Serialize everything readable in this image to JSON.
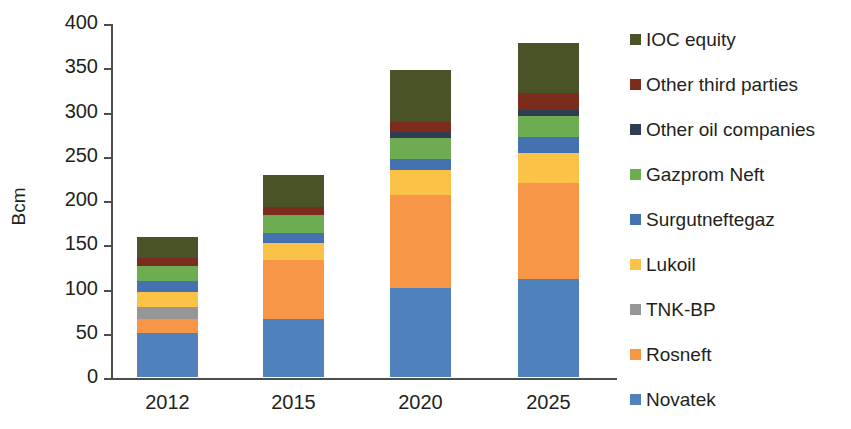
{
  "chart_data": {
    "type": "bar",
    "stacked": true,
    "title": "",
    "xlabel": "",
    "ylabel": "Bcm",
    "ylim": [
      0,
      400
    ],
    "ytick_step": 50,
    "yticks": [
      0,
      50,
      100,
      150,
      200,
      250,
      300,
      350,
      400
    ],
    "ytick_labels": [
      "0",
      "50",
      "100",
      "150",
      "200",
      "250",
      "300",
      "350",
      "400"
    ],
    "categories": [
      "2012",
      "2015",
      "2020",
      "2025"
    ],
    "grid": false,
    "legend_position": "right",
    "series": [
      {
        "name": "Novatek",
        "color": "#4f81bd",
        "values": [
          50,
          66,
          101,
          111
        ]
      },
      {
        "name": "Rosneft",
        "color": "#f79646",
        "values": [
          15,
          66,
          105,
          108
        ]
      },
      {
        "name": "TNK-BP",
        "color": "#969696",
        "values": [
          14,
          0,
          0,
          0
        ]
      },
      {
        "name": "Lukoil",
        "color": "#fac348",
        "values": [
          17,
          19,
          28,
          34
        ]
      },
      {
        "name": "Surgutneftegaz",
        "color": "#4472b0",
        "values": [
          13,
          12,
          12,
          18
        ]
      },
      {
        "name": "Gazprom Neft",
        "color": "#6eac52",
        "values": [
          16,
          20,
          24,
          24
        ]
      },
      {
        "name": "Other oil companies",
        "color": "#2f3c52",
        "values": [
          0,
          0,
          7,
          7
        ]
      },
      {
        "name": "Other third parties",
        "color": "#7b2c1c",
        "values": [
          9,
          9,
          11,
          19
        ]
      },
      {
        "name": "IOC equity",
        "color": "#4a5228",
        "values": [
          24,
          36,
          59,
          56
        ]
      }
    ],
    "totals": [
      158,
      228,
      347,
      377
    ],
    "legend_order_displayed": [
      "IOC equity",
      "Other third parties",
      "Other oil companies",
      "Gazprom Neft",
      "Surgutneftegaz",
      "Lukoil",
      "TNK-BP",
      "Rosneft",
      "Novatek"
    ]
  },
  "axis": {
    "y_title": "Bcm"
  },
  "legend": {
    "items": [
      {
        "label": "IOC equity",
        "color": "#4a5228"
      },
      {
        "label": "Other third parties",
        "color": "#7b2c1c"
      },
      {
        "label": "Other oil companies",
        "color": "#2f3c52"
      },
      {
        "label": "Gazprom Neft",
        "color": "#6eac52"
      },
      {
        "label": "Surgutneftegaz",
        "color": "#4472b0"
      },
      {
        "label": "Lukoil",
        "color": "#fac348"
      },
      {
        "label": "TNK-BP",
        "color": "#969696"
      },
      {
        "label": "Rosneft",
        "color": "#f79646"
      },
      {
        "label": "Novatek",
        "color": "#4f81bd"
      }
    ]
  }
}
